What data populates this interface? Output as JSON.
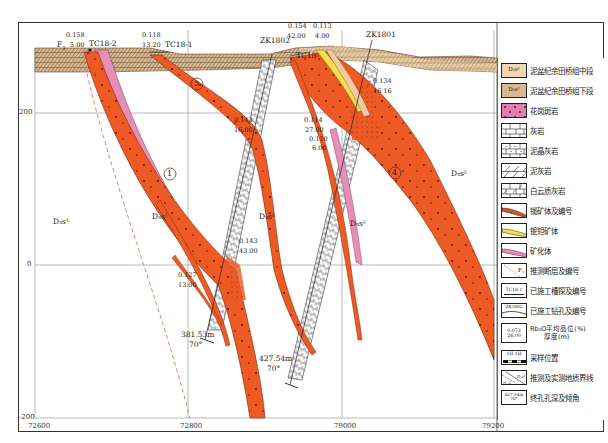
{
  "figure": {
    "type": "geological-cross-section",
    "x_axis": {
      "ticks": [
        {
          "label": "72600",
          "x": 35
        },
        {
          "label": "72800",
          "x": 188
        },
        {
          "label": "79000",
          "x": 342
        },
        {
          "label": "79200",
          "x": 494
        }
      ]
    },
    "y_axis": {
      "ticks": [
        {
          "label": "200",
          "y": 113
        },
        {
          "label": "0",
          "y": 265
        },
        {
          "label": "-200",
          "y": 418
        }
      ]
    }
  },
  "top_labels": {
    "fault": "F",
    "fault_sub": "3",
    "tc18_2": "TC18-2",
    "tc18_2_grade": "0.158",
    "tc18_2_thick": "5.00",
    "tc18_1": "TC18-1",
    "tc18_1_grade": "0.118",
    "tc18_1_thick": "13.20",
    "zk1802": "ZK1802",
    "zk1802_grade": "0.154",
    "zk1802_thick": "42.00",
    "zk1801": "ZK1801",
    "tc18_x_grade": "0.113",
    "tc18_x_thick": "4.00",
    "tc18_x": "TC18-"
  },
  "samples": [
    {
      "grade": "0.134",
      "thick": "16.16"
    },
    {
      "grade": "0.143",
      "thick": "16.00"
    },
    {
      "grade": "0.114",
      "thick": "27.00"
    },
    {
      "grade": "0.110",
      "thick": "6.00"
    },
    {
      "grade": "0.143",
      "thick": "43.00"
    },
    {
      "grade": "0.127",
      "thick": "13.00"
    }
  ],
  "boreholes": [
    {
      "depth": "381.53m",
      "angle": "70°"
    },
    {
      "depth": "427.54m",
      "angle": "70°"
    }
  ],
  "orebodies": [
    "1",
    "3",
    "4"
  ],
  "strata_labels": {
    "d3s1_a": "D₃s¹",
    "d3s1_b": "D₃s¹",
    "d3s2_a": "D₃s²",
    "d3s2_b": "D₃s²",
    "d3s2_c": "D₃s²"
  },
  "colors": {
    "orebody": "#ee5a24",
    "orebody_edge": "#8a2a10",
    "mineralized": "#e58fb6",
    "rb_ore": "#f2e14a",
    "strata_mid": "#f0d6b0",
    "strata_low": "#d9b996",
    "granite": "#e27fb0",
    "fault": "#e07050"
  },
  "legend": {
    "items": [
      {
        "label": "泥盆纪余田桥组中段",
        "swatch": "D₃s²"
      },
      {
        "label": "泥盆纪余田桥组下段",
        "swatch": "D₃s¹"
      },
      {
        "label": "花岗斑岩"
      },
      {
        "label": "灰岩"
      },
      {
        "label": "泥晶灰岩"
      },
      {
        "label": "泥灰岩"
      },
      {
        "label": "白云质灰岩"
      },
      {
        "label": "铷矿体及编号"
      },
      {
        "label": "铌钽矿体"
      },
      {
        "label": "矿化体"
      },
      {
        "label": "推测断层及编号",
        "swatch": "F₃"
      },
      {
        "label": "已施工槽探及编号",
        "swatch": "TC18-1"
      },
      {
        "label": "已施工钻孔及编号",
        "swatch": "ZK1802"
      },
      {
        "label": "Rb₂O平均品位(%)\n厚度(m)",
        "label_line1": "Rb₂O平均品位(%)",
        "label_line2": "厚度(m)",
        "swatch_top": "0.073",
        "swatch_bottom": "26.00"
      },
      {
        "label": "采样位置",
        "swatch": "1H  1H"
      },
      {
        "label": "推测及实测地质界线",
        "swatch": "D₃s¹"
      },
      {
        "label": "终孔孔深及倾角",
        "swatch_top": "427.54m",
        "swatch_bottom": "70°"
      }
    ]
  }
}
